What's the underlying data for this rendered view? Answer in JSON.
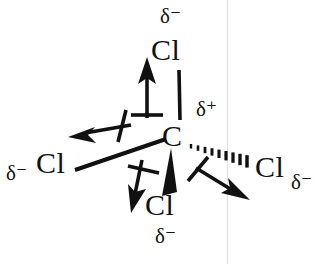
{
  "diagram": {
    "molecule": "CCl4",
    "ink_color": "#111111",
    "background_color": "#ffffff",
    "artifact_line_color": "#e2e2e2",
    "center_atom": {
      "symbol": "C",
      "charge": "δ⁺"
    },
    "substituents": [
      {
        "position": "top",
        "symbol": "Cl",
        "charge": "δ⁻",
        "bond_style": "plain-line"
      },
      {
        "position": "left",
        "symbol": "Cl",
        "charge": "δ⁻",
        "bond_style": "plain-line"
      },
      {
        "position": "right",
        "symbol": "Cl",
        "charge": "δ⁻",
        "bond_style": "hashed-wedge"
      },
      {
        "position": "bottom",
        "symbol": "Cl",
        "charge": "δ⁻",
        "bond_style": "solid-wedge"
      }
    ],
    "dipole_arrows": [
      {
        "name": "dipole-arrow-up",
        "direction": "up"
      },
      {
        "name": "dipole-arrow-left",
        "direction": "left"
      },
      {
        "name": "dipole-arrow-down-left",
        "direction": "down-left"
      },
      {
        "name": "dipole-arrow-down-right",
        "direction": "down-right"
      }
    ]
  }
}
